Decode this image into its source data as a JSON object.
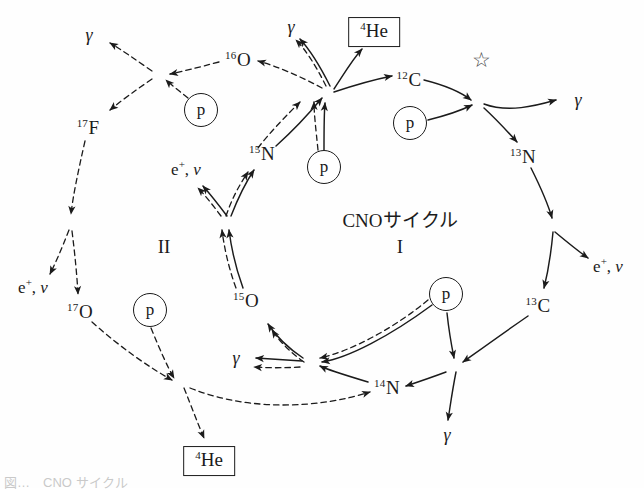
{
  "figure": {
    "caption": "図…　CNO サイクル",
    "cycle_one_title": "CNOサイクル",
    "cycle_one_numeral": "I",
    "cycle_two_numeral": "II",
    "star_marker": "☆",
    "proton_label": "p",
    "gamma_symbol": "γ",
    "helium_label_mass": "4",
    "helium_label_element": "He"
  },
  "nuclides": [
    {
      "id": "c12",
      "mass": "12",
      "element": "C",
      "x": 409,
      "y": 79
    },
    {
      "id": "n13",
      "mass": "13",
      "element": "N",
      "x": 523,
      "y": 156
    },
    {
      "id": "c13",
      "mass": "13",
      "element": "C",
      "x": 538,
      "y": 305
    },
    {
      "id": "n14",
      "mass": "14",
      "element": "N",
      "x": 387,
      "y": 387
    },
    {
      "id": "o15",
      "mass": "15",
      "element": "O",
      "x": 246,
      "y": 300
    },
    {
      "id": "n15",
      "mass": "15",
      "element": "N",
      "x": 262,
      "y": 153
    },
    {
      "id": "o16",
      "mass": "16",
      "element": "O",
      "x": 238,
      "y": 59
    },
    {
      "id": "f17",
      "mass": "17",
      "element": "F",
      "x": 88,
      "y": 127
    },
    {
      "id": "o17",
      "mass": "17",
      "element": "O",
      "x": 80,
      "y": 311
    }
  ],
  "protons": [
    {
      "id": "p-c12",
      "x": 410,
      "y": 123
    },
    {
      "id": "p-n14",
      "x": 446,
      "y": 294
    },
    {
      "id": "p-n15",
      "x": 324,
      "y": 167
    },
    {
      "id": "p-o16",
      "x": 201,
      "y": 110
    },
    {
      "id": "p-o17",
      "x": 150,
      "y": 310
    }
  ],
  "gammas": [
    {
      "id": "gamma-c12p",
      "x": 578,
      "y": 100
    },
    {
      "id": "gamma-n14p",
      "x": 447,
      "y": 435
    },
    {
      "id": "gamma-o15-branch",
      "x": 236,
      "y": 358
    },
    {
      "id": "gamma-n15p",
      "x": 291,
      "y": 27
    },
    {
      "id": "gamma-o16p",
      "x": 89,
      "y": 35
    }
  ],
  "leptons": [
    {
      "id": "lepton-n13",
      "x": 608,
      "y": 266
    },
    {
      "id": "lepton-o15",
      "x": 186,
      "y": 169
    },
    {
      "id": "lepton-f17",
      "x": 33,
      "y": 287
    },
    {
      "e_symbol": "e",
      "plus": "+",
      "nu": "ν",
      "separator": ","
    }
  ],
  "lepton_text": {
    "e_symbol": "e",
    "plus": "+",
    "nu": "ν",
    "separator": ","
  },
  "helium_boxes": [
    {
      "id": "he-top",
      "x": 374,
      "y": 32
    },
    {
      "id": "he-bottom",
      "x": 209,
      "y": 461
    }
  ],
  "colors": {
    "stroke": "#1b1b1b",
    "background": "#fefefe",
    "star": "#4a4a4a"
  },
  "reactions": {
    "cycle_I": [
      "12C + p -> 13N + γ",
      "13N -> 13C + e+ + ν",
      "13C + p -> 14N + γ",
      "14N + p -> 15O + γ",
      "15O -> 15N + e+ + ν",
      "15N + p -> 12C + 4He"
    ],
    "cycle_II": [
      "15N + p -> 16O + γ",
      "16O + p -> 17F + γ",
      "17F -> 17O + e+ + ν",
      "17O + p -> 14N + 4He"
    ]
  }
}
